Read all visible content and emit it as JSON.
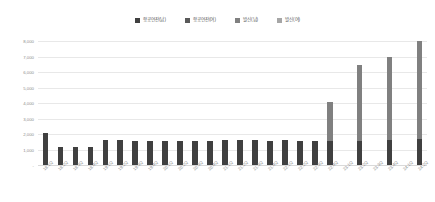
{
  "chart_data": {
    "type": "bar",
    "stacked": true,
    "title": "",
    "subtitle": "",
    "xlabel": "",
    "ylabel": "",
    "ylim": [
      0,
      8000
    ],
    "grid": true,
    "legend_position": "top-center",
    "y_ticks": [
      "-",
      "1,000",
      "2,000",
      "3,000",
      "4,000",
      "5,000",
      "6,000",
      "7,000",
      "8,000"
    ],
    "y_tick_values": [
      0,
      1000,
      2000,
      3000,
      4000,
      5000,
      6000,
      7000,
      8000
    ],
    "categories": [
      "18.1Q",
      "18.2Q",
      "18.3Q",
      "18.4Q",
      "19.1Q",
      "19.2Q",
      "19.3Q",
      "19.4Q",
      "20.1Q",
      "20.2Q",
      "20.3Q",
      "20.4Q",
      "21.1Q",
      "21.2Q",
      "21.3Q",
      "21.4Q",
      "22.1Q",
      "22.2Q",
      "22.3Q",
      "22.4Q",
      "23.1Q",
      "23.2Q",
      "23.3Q",
      "23.4Q",
      "24.1Q",
      "24.2Q"
    ],
    "series": [
      {
        "name": "항공연잔(남)",
        "color": "#404040",
        "values": [
          2050,
          1150,
          1180,
          1150,
          1600,
          1600,
          1580,
          1580,
          1580,
          1580,
          1580,
          1580,
          1600,
          1600,
          1590,
          1580,
          1590,
          1570,
          1570,
          1580,
          0,
          1580,
          0,
          1630,
          0,
          1700
        ]
      },
      {
        "name": "항공연잔(여)",
        "color": "#595959",
        "values": [
          0,
          0,
          0,
          0,
          0,
          0,
          0,
          0,
          0,
          0,
          0,
          0,
          0,
          0,
          0,
          0,
          0,
          0,
          0,
          0,
          0,
          0,
          0,
          0,
          0,
          0
        ]
      },
      {
        "name": "발신(남)",
        "color": "#808080",
        "values": [
          0,
          0,
          0,
          0,
          0,
          0,
          0,
          0,
          0,
          0,
          0,
          0,
          0,
          0,
          0,
          0,
          0,
          0,
          0,
          2500,
          0,
          4900,
          0,
          5350,
          0,
          6300
        ]
      },
      {
        "name": "발신(여)",
        "color": "#a6a6a6",
        "values": [
          0,
          0,
          0,
          0,
          0,
          0,
          0,
          0,
          0,
          0,
          0,
          0,
          0,
          0,
          0,
          0,
          0,
          0,
          0,
          0,
          0,
          0,
          0,
          0,
          0,
          0
        ]
      }
    ],
    "totals": [
      2050,
      1150,
      1180,
      1150,
      1600,
      1600,
      1580,
      1580,
      1580,
      1580,
      1580,
      1580,
      1600,
      1600,
      1590,
      1580,
      1590,
      1570,
      1570,
      4080,
      0,
      6480,
      0,
      6980,
      0,
      8000
    ]
  },
  "legend": {
    "items": [
      {
        "label": "항공연잔(남)",
        "color": "#404040"
      },
      {
        "label": "항공연잔(여)",
        "color": "#595959"
      },
      {
        "label": "발신(남)",
        "color": "#808080"
      },
      {
        "label": "발신(여)",
        "color": "#a6a6a6"
      }
    ]
  }
}
